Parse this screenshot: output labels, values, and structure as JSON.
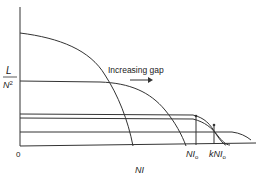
{
  "diagram": {
    "y_axis_label_numerator": "L",
    "y_axis_label_denominator": "N",
    "y_axis_label_exponent": "2",
    "x_axis_label": "NI",
    "origin_label": "0",
    "annotation": "Increasing gap",
    "marker_labels": {
      "ni0_main": "NI",
      "ni0_sub": "o",
      "kni0_prefix": "k",
      "kni0_main": "NI",
      "kni0_sub": "o"
    },
    "colors": {
      "line": "#333333",
      "background": "#ffffff"
    }
  }
}
